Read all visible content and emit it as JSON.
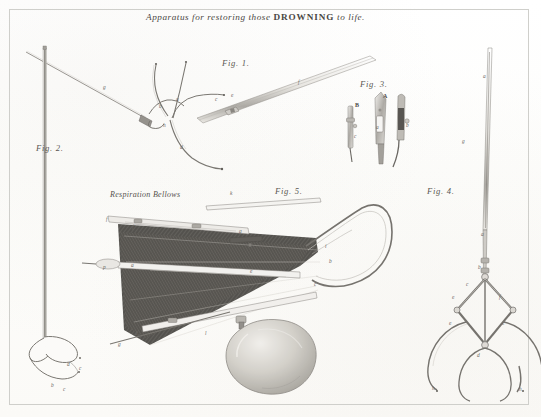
{
  "plate": {
    "width": 541,
    "height": 417,
    "background_color": "#fdfdfc",
    "ink_color": "#56534f",
    "border_color": "#cfcfcb",
    "title_prefix": "Apparatus for restoring those ",
    "title_emphasis": "DROWNING",
    "title_suffix": " to life."
  },
  "figures": [
    {
      "id": "fig1",
      "label": "Fig. 1.",
      "x": 222,
      "y": 58
    },
    {
      "id": "fig2",
      "label": "Fig. 2.",
      "x": 36,
      "y": 143
    },
    {
      "id": "fig3",
      "label": "Fig. 3.",
      "x": 360,
      "y": 79
    },
    {
      "id": "fig4",
      "label": "Fig. 4.",
      "x": 427,
      "y": 186
    },
    {
      "id": "fig5",
      "label": "Fig. 5.",
      "x": 275,
      "y": 186
    }
  ],
  "captions": [
    {
      "id": "respiration-bellows",
      "text": "Respiration Bellows",
      "x": 110,
      "y": 190
    }
  ],
  "keys": {
    "fig1": [
      {
        "letter": "a",
        "x": 176,
        "y": 96
      },
      {
        "letter": "b",
        "x": 159,
        "y": 103
      },
      {
        "letter": "h",
        "x": 163,
        "y": 122
      },
      {
        "letter": "c",
        "x": 215,
        "y": 96
      },
      {
        "letter": "d",
        "x": 180,
        "y": 144
      },
      {
        "letter": "e",
        "x": 231,
        "y": 92
      },
      {
        "letter": "f",
        "x": 298,
        "y": 79
      },
      {
        "letter": "g",
        "x": 103,
        "y": 84
      }
    ],
    "fig2": [
      {
        "letter": "d",
        "x": 67,
        "y": 361
      },
      {
        "letter": "c",
        "x": 79,
        "y": 365
      },
      {
        "letter": "b",
        "x": 51,
        "y": 382
      },
      {
        "letter": "c",
        "x": 63,
        "y": 386
      }
    ],
    "fig3": [
      {
        "letter": "A",
        "x": 383,
        "y": 93,
        "cap": true
      },
      {
        "letter": "B",
        "x": 355,
        "y": 102,
        "cap": true
      },
      {
        "letter": "a",
        "x": 376,
        "y": 124
      },
      {
        "letter": "b",
        "x": 406,
        "y": 122
      },
      {
        "letter": "c",
        "x": 354,
        "y": 133
      }
    ],
    "fig4": [
      {
        "letter": "a",
        "x": 483,
        "y": 73
      },
      {
        "letter": "g",
        "x": 462,
        "y": 138
      },
      {
        "letter": "a",
        "x": 481,
        "y": 231
      },
      {
        "letter": "b",
        "x": 478,
        "y": 264
      },
      {
        "letter": "c",
        "x": 466,
        "y": 281
      },
      {
        "letter": "e",
        "x": 452,
        "y": 294
      },
      {
        "letter": "f",
        "x": 499,
        "y": 294
      },
      {
        "letter": "e",
        "x": 449,
        "y": 320
      },
      {
        "letter": "e",
        "x": 502,
        "y": 320
      },
      {
        "letter": "d",
        "x": 477,
        "y": 352
      },
      {
        "letter": "h",
        "x": 432,
        "y": 385
      },
      {
        "letter": "h",
        "x": 519,
        "y": 386
      }
    ],
    "fig5": [
      {
        "letter": "k",
        "x": 230,
        "y": 190
      },
      {
        "letter": "f",
        "x": 106,
        "y": 216
      },
      {
        "letter": "f",
        "x": 132,
        "y": 224
      },
      {
        "letter": "g",
        "x": 239,
        "y": 228
      },
      {
        "letter": "a",
        "x": 131,
        "y": 262
      },
      {
        "letter": "p",
        "x": 103,
        "y": 264
      },
      {
        "letter": "i",
        "x": 325,
        "y": 243
      },
      {
        "letter": "b",
        "x": 329,
        "y": 258
      },
      {
        "letter": "c",
        "x": 314,
        "y": 281
      },
      {
        "letter": "d",
        "x": 135,
        "y": 330
      },
      {
        "letter": "g",
        "x": 118,
        "y": 341
      },
      {
        "letter": "l",
        "x": 205,
        "y": 330
      },
      {
        "letter": "e",
        "x": 250,
        "y": 268
      }
    ]
  }
}
